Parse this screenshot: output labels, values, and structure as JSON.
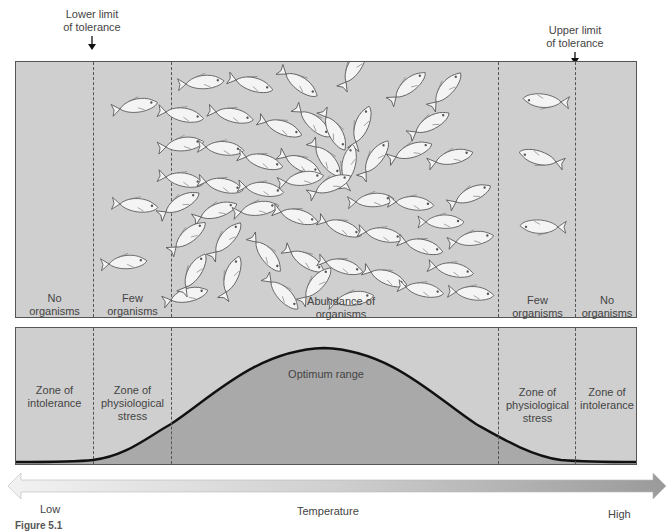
{
  "limits": {
    "lower": "Lower limit\nof tolerance",
    "upper": "Upper limit\nof tolerance"
  },
  "top_panel": {
    "zones": [
      {
        "label": "No\norganisms"
      },
      {
        "label": "Few\norganisms"
      },
      {
        "label": "Abundance of\norganisms"
      },
      {
        "label": "Few\norganisms"
      },
      {
        "label": "No\norganisms"
      }
    ]
  },
  "bottom_panel": {
    "zones": [
      {
        "label": "Zone of\nintolerance"
      },
      {
        "label": "Zone of\nphysiological\nstress"
      },
      {
        "label": "Optimum range"
      },
      {
        "label": "Zone of\nphysiological\nstress"
      },
      {
        "label": "Zone of\nintolerance"
      }
    ]
  },
  "axis": {
    "low": "Low",
    "title": "Temperature",
    "high": "High"
  },
  "caption": {
    "figure": "Figure 5.1"
  },
  "colors": {
    "panel_bg": "#cfcfcf",
    "curve_fill": "#a9a9a9",
    "curve_line": "#111111",
    "fish": "#f4f4f4"
  }
}
